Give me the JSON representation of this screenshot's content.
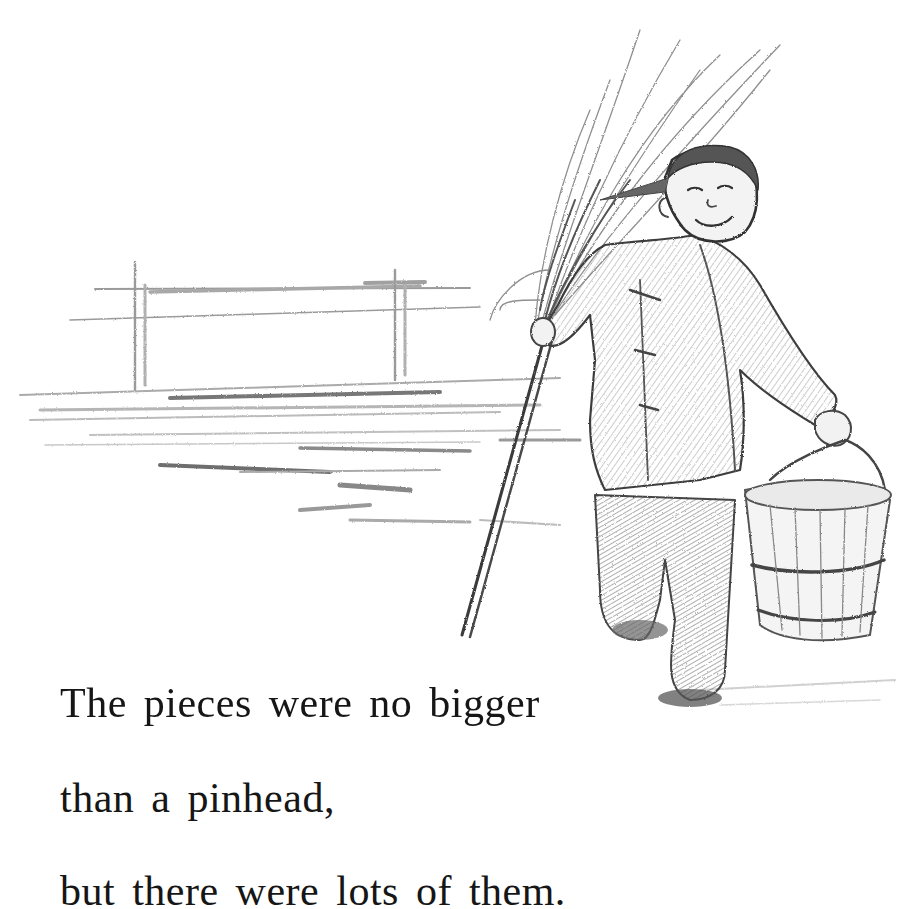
{
  "page": {
    "illustration": {
      "description": "Pencil sketch of a smiling child carrying a broom over the shoulder and a wooden bucket, walking in front of a wide open square with a gate-like structure in the distance",
      "elements": [
        "broom",
        "child",
        "wooden-bucket",
        "distant-gate",
        "open-ground"
      ],
      "colors": {
        "ink": "#3a3a3a",
        "shade": "#8a8a8a",
        "light": "#c4c4c4",
        "paper": "#ffffff"
      }
    },
    "text": {
      "lines": [
        "The pieces were no bigger",
        "than a pinhead,",
        "but there were lots of them."
      ]
    }
  }
}
